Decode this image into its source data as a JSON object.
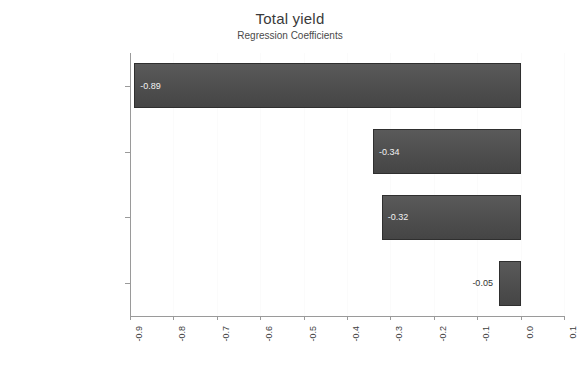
{
  "chart_data": {
    "type": "bar",
    "orientation": "horizontal",
    "title": "Total yield",
    "subtitle": "Regression Coefficients",
    "xlabel": "",
    "ylabel": "",
    "categories": [
      "Cutting",
      "Electroplating",
      "Cleaning",
      "Unpackaging, inspection"
    ],
    "values": [
      -0.89,
      -0.34,
      -0.32,
      -0.05
    ],
    "value_labels": [
      "-0.89",
      "-0.34",
      "-0.32",
      "-0.05"
    ],
    "xlim": [
      -0.9,
      0.1
    ],
    "xticks": [
      -0.9,
      -0.8,
      -0.7,
      -0.6,
      -0.5,
      -0.4,
      -0.3,
      -0.2,
      -0.1,
      0.0,
      0.1
    ],
    "xtick_labels": [
      "-0.9",
      "-0.8",
      "-0.7",
      "-0.6",
      "-0.5",
      "-0.4",
      "-0.3",
      "-0.2",
      "-0.1",
      "0.0",
      "0.1"
    ],
    "grid": true,
    "legend": false,
    "bar_color": "#4e4e4e",
    "bar_border_color": "#2f2f2f",
    "background_color": "#ffffff",
    "axis_color": "#9a9a9a",
    "label_inside_color": "#f2f2f2",
    "label_outside_color": "#333333"
  }
}
